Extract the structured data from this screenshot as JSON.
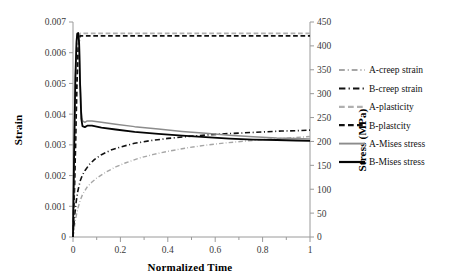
{
  "chart_data": {
    "type": "line",
    "title": "",
    "xlabel": "Normalized Time",
    "ylabel": "Strain",
    "y2label": "Stress (MPa)",
    "xlim": [
      0,
      1
    ],
    "ylim": [
      0,
      0.007
    ],
    "y2lim": [
      0,
      450
    ],
    "grid": false,
    "legend_position": "right",
    "x_ticks": [
      "0",
      "0.2",
      "0.4",
      "0.6",
      "0.8",
      "1"
    ],
    "x_tick_values": [
      0,
      0.2,
      0.4,
      0.6,
      0.8,
      1
    ],
    "x_minor_step": 0.1,
    "y_ticks": [
      "0",
      "0.001",
      "0.002",
      "0.003",
      "0.004",
      "0.005",
      "0.006",
      "0.007"
    ],
    "y_tick_values": [
      0,
      0.001,
      0.002,
      0.003,
      0.004,
      0.005,
      0.006,
      0.007
    ],
    "y2_ticks": [
      "0",
      "50",
      "100",
      "150",
      "200",
      "250",
      "300",
      "350",
      "400",
      "450"
    ],
    "y2_tick_values": [
      0,
      50,
      100,
      150,
      200,
      250,
      300,
      350,
      400,
      450
    ],
    "series": [
      {
        "name": "A-creep strain",
        "axis": "left",
        "color": "#a6a6a6",
        "style": "dashdot",
        "width": 1.4,
        "x": [
          0,
          0.005,
          0.01,
          0.02,
          0.03,
          0.04,
          0.06,
          0.08,
          0.1,
          0.14,
          0.18,
          0.22,
          0.28,
          0.34,
          0.4,
          0.48,
          0.56,
          0.64,
          0.72,
          0.8,
          0.88,
          0.94,
          1
        ],
        "values": [
          0,
          0.00028,
          0.00055,
          0.00092,
          0.00118,
          0.00138,
          0.00163,
          0.00179,
          0.00192,
          0.00212,
          0.00228,
          0.00241,
          0.00257,
          0.00269,
          0.00279,
          0.0029,
          0.00299,
          0.00306,
          0.00312,
          0.00317,
          0.00321,
          0.00324,
          0.00327
        ]
      },
      {
        "name": "B-creep strain",
        "axis": "left",
        "color": "#111111",
        "style": "dashdot",
        "width": 1.6,
        "x": [
          0,
          0.004,
          0.008,
          0.014,
          0.02,
          0.03,
          0.04,
          0.05,
          0.07,
          0.09,
          0.12,
          0.16,
          0.2,
          0.26,
          0.32,
          0.4,
          0.48,
          0.56,
          0.64,
          0.72,
          0.8,
          0.88,
          0.94,
          1
        ],
        "values": [
          0,
          0.0004,
          0.00078,
          0.00118,
          0.00148,
          0.00182,
          0.00202,
          0.00216,
          0.00237,
          0.00252,
          0.00268,
          0.00283,
          0.00293,
          0.00305,
          0.00313,
          0.00321,
          0.00327,
          0.00332,
          0.00336,
          0.00339,
          0.00342,
          0.00345,
          0.00346,
          0.00348
        ]
      },
      {
        "name": "A-plasticity",
        "axis": "left",
        "color": "#b0b0b0",
        "style": "dashed",
        "width": 1.8,
        "x": [
          0,
          0.008,
          0.016,
          0.022,
          0.03,
          0.1,
          0.3,
          0.5,
          0.7,
          0.9,
          1
        ],
        "values": [
          0,
          0.0022,
          0.0049,
          0.00625,
          0.00663,
          0.00663,
          0.00663,
          0.00663,
          0.00663,
          0.00663,
          0.00663
        ]
      },
      {
        "name": "B-plastcity",
        "axis": "left",
        "color": "#111111",
        "style": "dashed",
        "width": 1.8,
        "x": [
          0,
          0.008,
          0.016,
          0.022,
          0.03,
          0.1,
          0.3,
          0.5,
          0.7,
          0.9,
          1
        ],
        "values": [
          0,
          0.0022,
          0.0049,
          0.0062,
          0.00655,
          0.00655,
          0.00655,
          0.00655,
          0.00655,
          0.00655,
          0.00655
        ]
      },
      {
        "name": "A-Mises stress",
        "axis": "right",
        "color": "#8c8c8c",
        "style": "solid",
        "width": 1.5,
        "x": [
          0,
          0.004,
          0.01,
          0.015,
          0.018,
          0.022,
          0.026,
          0.03,
          0.035,
          0.04,
          0.05,
          0.06,
          0.08,
          0.12,
          0.18,
          0.26,
          0.36,
          0.46,
          0.56,
          0.66,
          0.76,
          0.86,
          0.94,
          1
        ],
        "values": [
          0,
          150,
          330,
          405,
          424,
          426,
          410,
          330,
          262,
          243,
          240,
          243,
          243,
          240,
          236,
          231,
          226,
          221,
          217,
          213,
          210,
          207,
          206,
          205
        ]
      },
      {
        "name": "B-Mises stress",
        "axis": "right",
        "color": "#050505",
        "style": "solid",
        "width": 1.8,
        "x": [
          0,
          0.004,
          0.01,
          0.015,
          0.018,
          0.022,
          0.026,
          0.03,
          0.035,
          0.04,
          0.05,
          0.06,
          0.08,
          0.12,
          0.18,
          0.26,
          0.36,
          0.46,
          0.56,
          0.66,
          0.76,
          0.86,
          0.94,
          1
        ],
        "values": [
          0,
          152,
          335,
          410,
          426,
          427,
          405,
          318,
          248,
          232,
          230,
          233,
          233,
          229,
          225,
          220,
          216,
          212,
          209,
          206,
          204,
          203,
          202,
          201
        ]
      }
    ]
  },
  "legend": {
    "entries": [
      {
        "label": "A-creep strain"
      },
      {
        "label": "B-creep strain"
      },
      {
        "label": "A-plasticity"
      },
      {
        "label": "B-plastcity"
      },
      {
        "label": "A-Mises stress"
      },
      {
        "label": "B-Mises stress"
      }
    ]
  },
  "axes": {
    "x_title": "Normalized Time",
    "y_left_title": "Strain",
    "y_right_title": "Stress (MPa)"
  },
  "colors": {
    "axis": "#9a9a9a",
    "text": "#1a1a1a",
    "gray_series": "#a6a6a6",
    "black_series": "#111111"
  }
}
